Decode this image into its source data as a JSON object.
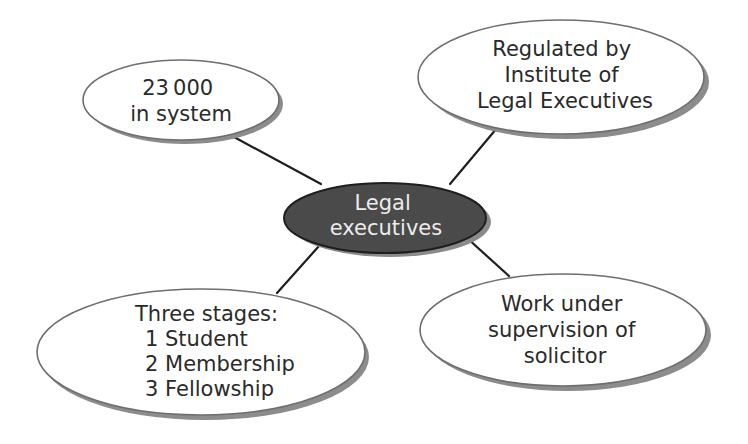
{
  "diagram": {
    "type": "mind-map",
    "colors": {
      "background": "#ffffff",
      "center_fill": "#4a4a4a",
      "center_stroke": "#1e1e1e",
      "center_text": "#ececec",
      "node_fill": "#ffffff",
      "node_stroke": "#6e6e6e",
      "node_shadow": "#8c8c8c",
      "node_text": "#2a2a2a",
      "connector": "#1e1e1e"
    },
    "center": {
      "lines": [
        "Legal",
        "executives"
      ]
    },
    "nodes": [
      {
        "id": "count",
        "position": "top-left",
        "lines": [
          "23 000",
          "in system"
        ]
      },
      {
        "id": "regulator",
        "position": "top-right",
        "lines": [
          "Regulated by",
          "Institute of",
          "Legal Executives"
        ]
      },
      {
        "id": "stages",
        "position": "bottom-left",
        "lines": [
          "Three stages:",
          "1 Student",
          "2 Membership",
          "3 Fellowship"
        ]
      },
      {
        "id": "supervision",
        "position": "bottom-right",
        "lines": [
          "Work under",
          "supervision of",
          "solicitor"
        ]
      }
    ]
  }
}
